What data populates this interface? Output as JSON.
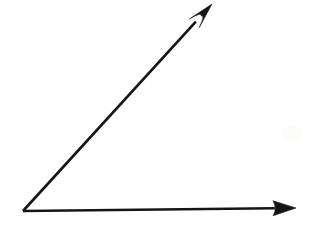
{
  "figure": {
    "title": "Angle formed by two rays",
    "background_color": "#ffffff",
    "ink_color": "#151515",
    "canvas": {
      "width": 317,
      "height": 237
    }
  },
  "chart_data": {
    "type": "diagram",
    "title": "Angle formed by two rays",
    "subtitle": "",
    "xlabel": "",
    "ylabel": "",
    "grid": false,
    "legend": null,
    "background_color": "#ffffff",
    "stroke_color": "#151515",
    "stroke_width": 2.6,
    "vertex": {
      "name": "vertex",
      "x": 23,
      "y": 211
    },
    "rays": [
      {
        "name": "horizontal-ray",
        "from": {
          "x": 23,
          "y": 211
        },
        "to": {
          "x": 296,
          "y": 208
        },
        "arrowhead": "solid-triangle",
        "arrow_length": 23,
        "arrow_width": 15,
        "angle_degrees": 0.6
      },
      {
        "name": "diagonal-ray",
        "from": {
          "x": 23,
          "y": 211
        },
        "to": {
          "x": 212,
          "y": 4
        },
        "arrowhead": "barbed",
        "arrow_length": 26,
        "arrow_width": 13,
        "angle_degrees": 47.6
      }
    ],
    "measured_angle_degrees": 47,
    "annotations": []
  }
}
